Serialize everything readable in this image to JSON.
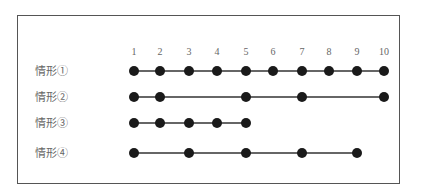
{
  "diagram": {
    "positions": [
      "1",
      "2",
      "3",
      "4",
      "5",
      "6",
      "7",
      "8",
      "9",
      "10"
    ],
    "rows": [
      {
        "label": "情形①",
        "points": [
          1,
          2,
          3,
          4,
          5,
          6,
          7,
          8,
          9,
          10
        ]
      },
      {
        "label": "情形②",
        "points": [
          1,
          2,
          5,
          7,
          10
        ]
      },
      {
        "label": "情形③",
        "points": [
          1,
          2,
          3,
          4,
          5
        ]
      },
      {
        "label": "情形④",
        "points": [
          1,
          3,
          5,
          7,
          9
        ]
      }
    ],
    "colors": {
      "dot": "#1a1a1a",
      "line": "#333333",
      "text": "#666666",
      "border": "#555555"
    }
  }
}
